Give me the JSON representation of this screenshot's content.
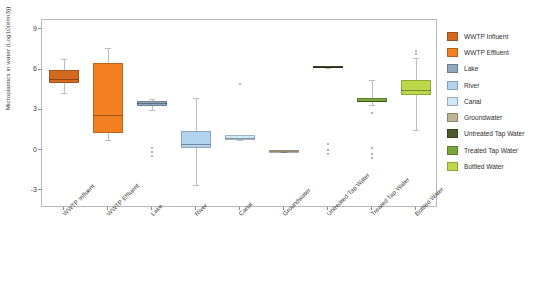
{
  "chart_data": {
    "type": "box",
    "title": "",
    "xlabel": "",
    "ylabel": "Microplastics in water (Log10(#/m3))",
    "ylim": [
      -4.2,
      9.8
    ],
    "yticks": [
      9,
      6,
      3,
      0,
      -3
    ],
    "grid": false,
    "legend_position": "right",
    "categories": [
      "WWTP Influent",
      "WWTP Effluent",
      "Lake",
      "River",
      "Canal",
      "Groundwater",
      "Untreated Tap Water",
      "Treated Tap Water",
      "Bottled Water"
    ],
    "colors": [
      "#d2691e",
      "#f28022",
      "#8fa8bf",
      "#b3d4ef",
      "#cfe6f7",
      "#bfb295",
      "#4d5a2c",
      "#7aa63c",
      "#bcd84a"
    ],
    "boxes": [
      {
        "name": "WWTP Influent",
        "color": "#d2691e",
        "whisker_low": 4.4,
        "q1": 5.1,
        "median": 5.4,
        "q3": 6.1,
        "whisker_high": 6.9,
        "outliers": []
      },
      {
        "name": "WWTP Effluent",
        "color": "#f28022",
        "whisker_low": 0.9,
        "q1": 1.4,
        "median": 2.7,
        "q3": 6.6,
        "whisker_high": 7.7,
        "outliers": []
      },
      {
        "name": "Lake",
        "color": "#8fa8bf",
        "whisker_low": 3.1,
        "q1": 3.4,
        "median": 3.6,
        "q3": 3.8,
        "whisker_high": 3.9,
        "outliers": [
          0.3,
          0.0,
          -0.3
        ]
      },
      {
        "name": "River",
        "color": "#b3d4ef",
        "whisker_low": -2.5,
        "q1": 0.3,
        "median": 0.6,
        "q3": 1.5,
        "whisker_high": 4.0,
        "outliers": []
      },
      {
        "name": "Canal",
        "color": "#cfe6f7",
        "whisker_low": 0.9,
        "q1": 0.9,
        "median": 1.0,
        "q3": 1.2,
        "whisker_high": 1.2,
        "outliers": [
          5.0
        ]
      },
      {
        "name": "Groundwater",
        "color": "#bfb295",
        "whisker_low": 0.0,
        "q1": 0.0,
        "median": 0.0,
        "q3": 0.1,
        "whisker_high": 0.1,
        "outliers": []
      },
      {
        "name": "Untreated Tap Water",
        "color": "#4d5a2c",
        "whisker_low": 6.2,
        "q1": 6.2,
        "median": 6.3,
        "q3": 6.4,
        "whisker_high": 6.4,
        "outliers": [
          0.6,
          0.1,
          -0.2
        ]
      },
      {
        "name": "Treated Tap Water",
        "color": "#7aa63c",
        "whisker_low": 3.5,
        "q1": 3.7,
        "median": 3.8,
        "q3": 4.0,
        "whisker_high": 5.3,
        "outliers": [
          2.9,
          0.3,
          -0.2,
          -0.5
        ]
      },
      {
        "name": "Bottled Water",
        "color": "#bcd84a",
        "whisker_low": 1.6,
        "q1": 4.2,
        "median": 4.6,
        "q3": 5.3,
        "whisker_high": 7.0,
        "outliers": [
          7.5,
          7.3
        ]
      }
    ]
  },
  "legend": {
    "items": [
      {
        "label": "WWTP Influent",
        "color": "#d2691e"
      },
      {
        "label": "WWTP Effluent",
        "color": "#f28022"
      },
      {
        "label": "Lake",
        "color": "#8fa8bf"
      },
      {
        "label": "River",
        "color": "#b3d4ef"
      },
      {
        "label": "Canal",
        "color": "#cfe6f7"
      },
      {
        "label": "Groundwater",
        "color": "#bfb295"
      },
      {
        "label": "Untreated Tap Water",
        "color": "#4d5a2c"
      },
      {
        "label": "Treated Tap Water",
        "color": "#7aa63c"
      },
      {
        "label": "Bottled Water",
        "color": "#bcd84a"
      }
    ]
  }
}
